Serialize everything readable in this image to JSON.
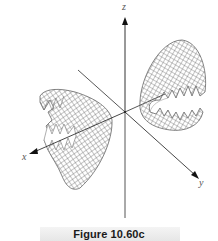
{
  "figure": {
    "caption": "Figure 10.60c",
    "axes": {
      "x": {
        "label": "x"
      },
      "y": {
        "label": "y"
      },
      "z": {
        "label": "z"
      }
    },
    "surfaces": [
      {
        "name": "right-sheet",
        "description": "wireframe parabolic sheet opening toward negative y, above the xy-plane"
      },
      {
        "name": "left-sheet",
        "description": "wireframe parabolic sheet opening toward positive y, below/front of the xy-plane"
      }
    ],
    "colors": {
      "axis": "#333333",
      "mesh": "#6a6a6a",
      "caption_band": "#ececec",
      "caption_text": "#1a1a1a"
    }
  }
}
